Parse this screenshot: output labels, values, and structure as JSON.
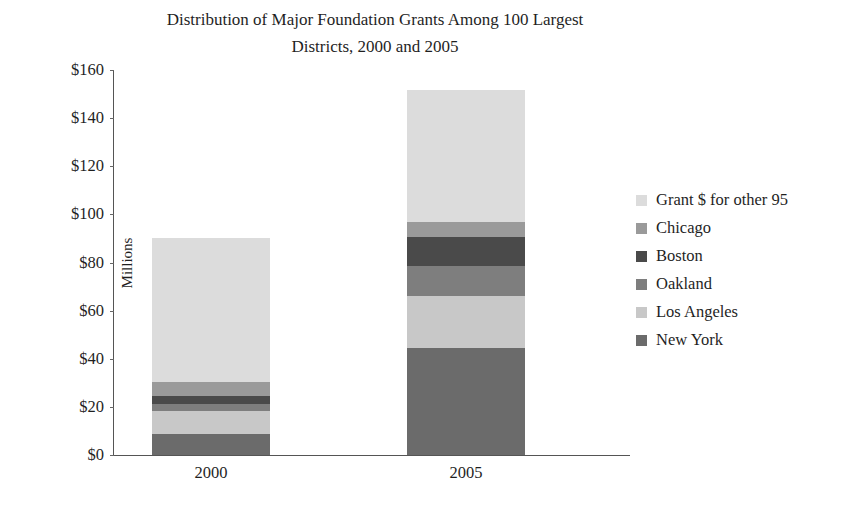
{
  "chart_data": {
    "type": "bar",
    "subtype": "stacked",
    "title": "Distribution of Major Foundation Grants Among 100 Largest Districts, 2000 and 2005",
    "title_line1": "Distribution of Major Foundation Grants Among 100 Largest",
    "title_line2": "Districts, 2000 and 2005",
    "xlabel": "",
    "ylabel": "Millions",
    "categories": [
      "2000",
      "2005"
    ],
    "ylim": [
      0,
      160
    ],
    "ytick_step": 20,
    "ytick_labels": [
      "$160",
      "$140",
      "$120",
      "$100",
      "$80",
      "$60",
      "$40",
      "$20",
      "$0"
    ],
    "ytick_values": [
      160,
      140,
      120,
      100,
      80,
      60,
      40,
      20,
      0
    ],
    "grid": false,
    "legend_position": "right",
    "stack_order_bottom_to_top": [
      "New York",
      "Los Angeles",
      "Oakland",
      "Boston",
      "Chicago",
      "Grant $ for other 95"
    ],
    "series": [
      {
        "name": "Grant $ for other 95",
        "color": "#dcdcdc",
        "values": [
          60.0,
          55.0
        ]
      },
      {
        "name": "Chicago",
        "color": "#9a9a9a",
        "values": [
          5.8,
          6.2
        ]
      },
      {
        "name": "Boston",
        "color": "#4a4a4a",
        "values": [
          3.3,
          12.0
        ]
      },
      {
        "name": "Oakland",
        "color": "#7e7e7e",
        "values": [
          3.0,
          12.5
        ]
      },
      {
        "name": "Los Angeles",
        "color": "#c8c8c8",
        "values": [
          9.6,
          21.6
        ]
      },
      {
        "name": "New York",
        "color": "#6b6b6b",
        "values": [
          8.7,
          44.5
        ]
      }
    ],
    "totals": [
      90.4,
      151.8
    ]
  }
}
